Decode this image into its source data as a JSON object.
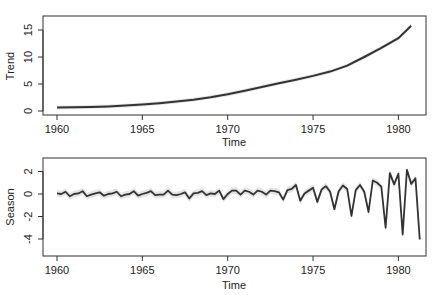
{
  "chart_data": [
    {
      "type": "line",
      "title": "",
      "xlabel": "Time",
      "ylabel": "Trend",
      "xlim": [
        1959.2,
        1981.5
      ],
      "ylim": [
        -0.6,
        17.5
      ],
      "x_ticks": [
        1960,
        1965,
        1970,
        1975,
        1980
      ],
      "y_ticks": [
        0,
        5,
        10,
        15
      ],
      "grid": false,
      "band": true,
      "x": [
        1960,
        1961,
        1962,
        1963,
        1964,
        1965,
        1966,
        1967,
        1968,
        1969,
        1970,
        1971,
        1972,
        1973,
        1974,
        1975,
        1976,
        1977,
        1978,
        1979,
        1980,
        1980.75
      ],
      "values": [
        0.65,
        0.68,
        0.75,
        0.85,
        1.0,
        1.2,
        1.45,
        1.75,
        2.1,
        2.55,
        3.1,
        3.75,
        4.45,
        5.15,
        5.8,
        6.5,
        7.3,
        8.4,
        10.0,
        11.7,
        13.5,
        15.8
      ]
    },
    {
      "type": "line",
      "title": "",
      "xlabel": "Time",
      "ylabel": "Season",
      "xlim": [
        1959.2,
        1981.5
      ],
      "ylim": [
        -5.5,
        3.2
      ],
      "x_ticks": [
        1960,
        1965,
        1970,
        1975,
        1980
      ],
      "y_ticks": [
        -4,
        -2,
        0,
        2
      ],
      "grid": false,
      "band": true,
      "x_start": 1960,
      "x_step": 0.25,
      "values": [
        0.05,
        0.0,
        0.2,
        -0.2,
        0.0,
        0.05,
        0.25,
        -0.2,
        -0.05,
        0.05,
        0.15,
        -0.15,
        0.0,
        0.05,
        0.2,
        -0.2,
        -0.05,
        0.0,
        0.25,
        -0.15,
        0.0,
        0.1,
        0.25,
        -0.1,
        -0.05,
        -0.05,
        0.3,
        -0.05,
        -0.1,
        0.0,
        0.15,
        -0.4,
        0.05,
        0.1,
        0.25,
        -0.1,
        0.05,
        0.0,
        0.3,
        -0.45,
        0.0,
        0.3,
        0.3,
        -0.05,
        0.3,
        0.2,
        -0.05,
        0.3,
        0.2,
        -0.05,
        0.3,
        0.25,
        0.15,
        -0.5,
        0.35,
        0.45,
        0.8,
        -0.6,
        0.05,
        0.3,
        0.55,
        -0.7,
        0.4,
        0.7,
        0.2,
        -1.35,
        0.25,
        0.75,
        0.45,
        -1.95,
        0.35,
        0.8,
        0.2,
        -1.6,
        1.2,
        1.0,
        0.65,
        -3.0,
        1.85,
        0.85,
        1.8,
        -3.6,
        2.15,
        0.9,
        1.4,
        -4.05
      ]
    }
  ],
  "panels": {
    "top": {
      "ylabel": "Trend",
      "xlabel": "Time",
      "yticks": [
        "0",
        "5",
        "10",
        "15"
      ],
      "xticks": [
        "1960",
        "1965",
        "1970",
        "1975",
        "1980"
      ]
    },
    "bottom": {
      "ylabel": "Season",
      "xlabel": "Time",
      "yticks": [
        "-4",
        "-2",
        "0",
        "2"
      ],
      "xticks": [
        "1960",
        "1965",
        "1970",
        "1975",
        "1980"
      ]
    }
  },
  "colors": {
    "line": "#333333",
    "band": "#dcdcdc",
    "axis": "#333333"
  }
}
